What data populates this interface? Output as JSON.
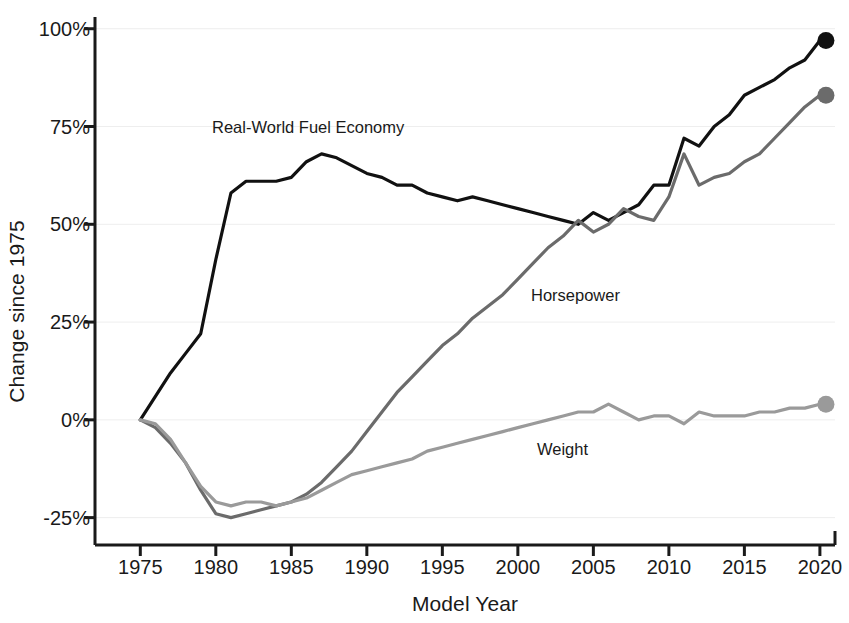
{
  "chart_data": {
    "type": "line",
    "title": "",
    "xlabel": "Model Year",
    "ylabel": "Change since 1975",
    "xlim": [
      1972,
      2021
    ],
    "ylim": [
      -32,
      103
    ],
    "grid": true,
    "grid_axis": "y",
    "legend": "inline-annotations",
    "x_ticks": [
      1975,
      1980,
      1985,
      1990,
      1995,
      2000,
      2005,
      2010,
      2015,
      2020
    ],
    "x_tick_labels": [
      "1975",
      "1980",
      "1985",
      "1990",
      "1995",
      "2000",
      "2005",
      "2010",
      "2015",
      "2020"
    ],
    "y_ticks": [
      -25,
      0,
      25,
      50,
      75,
      100
    ],
    "y_tick_labels": [
      "-25%",
      "0%",
      "25%",
      "50%",
      "75%",
      "100%"
    ],
    "x": [
      1975,
      1976,
      1977,
      1978,
      1979,
      1980,
      1981,
      1982,
      1983,
      1984,
      1985,
      1986,
      1987,
      1988,
      1989,
      1990,
      1991,
      1992,
      1993,
      1994,
      1995,
      1996,
      1997,
      1998,
      1999,
      2000,
      2001,
      2002,
      2003,
      2004,
      2005,
      2006,
      2007,
      2008,
      2009,
      2010,
      2011,
      2012,
      2013,
      2014,
      2015,
      2016,
      2017,
      2018,
      2019
    ],
    "series": [
      {
        "name": "Real-World Fuel Economy",
        "color": "#111111",
        "label_position": {
          "x": 212,
          "y": 118
        },
        "endpoint_marker": true,
        "endpoint_value": 97,
        "values": [
          0,
          6,
          12,
          17,
          22,
          41,
          58,
          61,
          61,
          61,
          62,
          66,
          68,
          67,
          65,
          63,
          62,
          60,
          60,
          58,
          57,
          56,
          57,
          56,
          55,
          54,
          53,
          52,
          51,
          50,
          53,
          51,
          53,
          55,
          60,
          60,
          72,
          70,
          75,
          78,
          83,
          85,
          87,
          90,
          92
        ],
        "final_point": {
          "year": 2020,
          "value": 97
        }
      },
      {
        "name": "Horsepower",
        "color": "#6b6b6b",
        "label_position": {
          "x": 531,
          "y": 286
        },
        "endpoint_marker": true,
        "endpoint_value": 83,
        "values": [
          0,
          -2,
          -6,
          -11,
          -18,
          -24,
          -25,
          -24,
          -23,
          -22,
          -21,
          -19,
          -16,
          -12,
          -8,
          -3,
          2,
          7,
          11,
          15,
          19,
          22,
          26,
          29,
          32,
          36,
          40,
          44,
          47,
          51,
          48,
          50,
          54,
          52,
          51,
          57,
          68,
          60,
          62,
          63,
          66,
          68,
          72,
          76,
          80
        ],
        "final_point": {
          "year": 2020,
          "value": 83
        }
      },
      {
        "name": "Weight",
        "color": "#9a9a9a",
        "label_position": {
          "x": 537,
          "y": 440
        },
        "endpoint_marker": true,
        "endpoint_value": 4,
        "values": [
          0,
          -1,
          -5,
          -11,
          -17,
          -21,
          -22,
          -21,
          -21,
          -22,
          -21,
          -20,
          -18,
          -16,
          -14,
          -13,
          -12,
          -11,
          -10,
          -8,
          -7,
          -6,
          -5,
          -4,
          -3,
          -2,
          -1,
          0,
          1,
          2,
          2,
          4,
          2,
          0,
          1,
          1,
          -1,
          2,
          1,
          1,
          1,
          2,
          2,
          3,
          3
        ],
        "final_point": {
          "year": 2020,
          "value": 4
        }
      }
    ]
  },
  "axes": {
    "x_title": "Model Year",
    "y_title": "Change since 1975"
  },
  "annotations": {
    "fuel_economy_label": "Real-World Fuel Economy",
    "horsepower_label": "Horsepower",
    "weight_label": "Weight"
  },
  "colors": {
    "fuel_economy": "#111111",
    "horsepower": "#6b6b6b",
    "weight": "#9a9a9a",
    "axis": "#1a1a1a",
    "grid": "#eeeeee",
    "background": "#ffffff"
  }
}
